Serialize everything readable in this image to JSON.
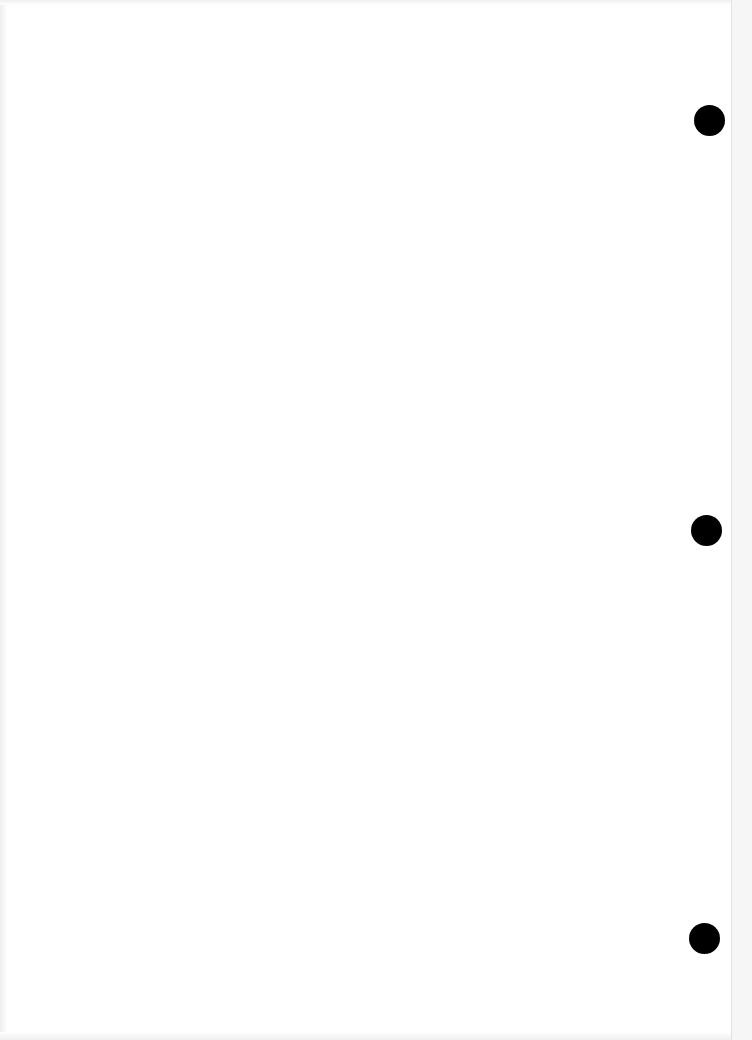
{
  "document": {
    "type": "blank scanned page",
    "text": "",
    "background_color": "#ffffff",
    "punch_holes": [
      {
        "cx": 709,
        "cy": 120,
        "diameter": 31,
        "color": "#000000"
      },
      {
        "cx": 706,
        "cy": 530,
        "diameter": 31,
        "color": "#000000"
      },
      {
        "cx": 704,
        "cy": 938,
        "diameter": 31,
        "color": "#000000"
      }
    ]
  }
}
